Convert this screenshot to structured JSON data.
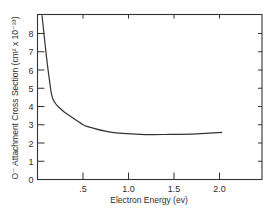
{
  "chart_data": {
    "type": "line",
    "title": "",
    "xlabel": "Electron Energy (ev)",
    "ylabel": "O⁻ Attachment Cross Section (cm² x 10⁻²³)",
    "xlim": [
      0,
      2.45
    ],
    "ylim": [
      0,
      8.1
    ],
    "grid": false,
    "legend": null,
    "x_ticks": [
      ".5",
      "1.0",
      "1.5",
      "2.0"
    ],
    "x_tick_values": [
      0.5,
      1.0,
      1.5,
      2.0
    ],
    "y_ticks": [
      "0",
      "1",
      "2",
      "3",
      "4",
      "5",
      "6",
      "7",
      "8"
    ],
    "y_tick_values": [
      0,
      1,
      2,
      3,
      4,
      5,
      6,
      7,
      8
    ],
    "series": [
      {
        "name": "O- attachment cross section",
        "x": [
          0.05,
          0.09,
          0.13,
          0.17,
          0.27,
          0.41,
          0.47,
          0.55,
          0.8,
          1.13,
          1.46,
          1.75,
          2.03
        ],
        "y": [
          9.0,
          7.1,
          5.5,
          4.4,
          3.8,
          3.3,
          3.1,
          2.9,
          2.6,
          2.47,
          2.47,
          2.5,
          2.58
        ]
      }
    ]
  }
}
